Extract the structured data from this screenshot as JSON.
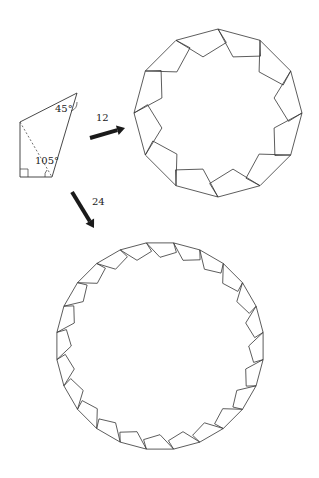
{
  "colors": {
    "stroke": "#333333",
    "arrow": "#1a1a1a",
    "background": "#ffffff"
  },
  "quadrilateral": {
    "vertices": [
      [
        77,
        93
      ],
      [
        52,
        177
      ],
      [
        20,
        177
      ],
      [
        20,
        122
      ]
    ],
    "diagonal": [
      [
        20,
        122
      ],
      [
        52,
        177
      ]
    ],
    "angle_labels": {
      "top_right": "45°",
      "bottom_right": "105°"
    },
    "right_angle_marker": "bottom-left"
  },
  "arrows": [
    {
      "label": "12",
      "from": [
        90,
        138
      ],
      "to": [
        125,
        128
      ],
      "label_pos": [
        96,
        112
      ]
    },
    {
      "label": "24",
      "from": [
        72,
        192
      ],
      "to": [
        94,
        228
      ],
      "label_pos": [
        92,
        196
      ]
    }
  ],
  "polygons": [
    {
      "sides": 12,
      "center": [
        218,
        113
      ],
      "radius": 84,
      "rotation_deg": -90
    },
    {
      "sides": 24,
      "center": [
        160,
        346
      ],
      "radius": 104,
      "rotation_deg": -97.5
    }
  ],
  "tile_shape_edge_frame": [
    [
      0,
      0
    ],
    [
      1,
      0
    ],
    [
      1.105,
      0.35
    ],
    [
      0.5,
      0.53
    ]
  ]
}
